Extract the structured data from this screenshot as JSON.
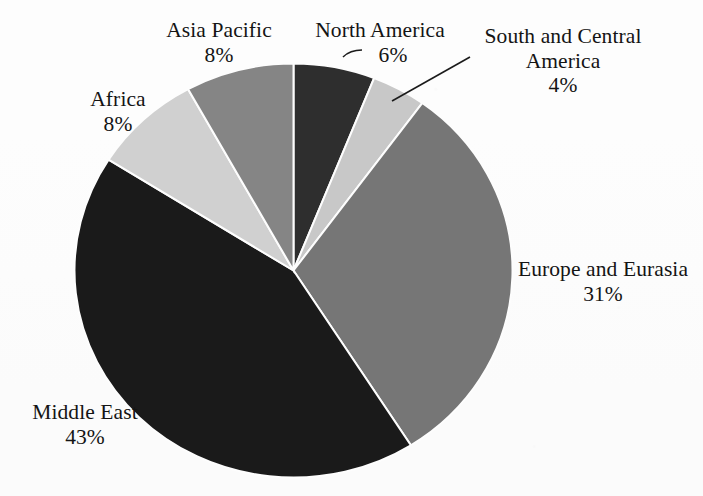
{
  "figure": {
    "background_color": "#fdfdfd",
    "text_color": "#141414"
  },
  "chart_data": {
    "type": "pie",
    "title": "",
    "subtitle": "",
    "xlabel": "",
    "ylabel": "",
    "legend_position": "none",
    "labels_position": "outside",
    "start_angle_deg": 0,
    "direction": "clockwise",
    "categories": [
      "North America",
      "South and Central America",
      "Europe and Eurasia",
      "Middle East",
      "Africa",
      "Asia Pacific"
    ],
    "values": [
      6,
      4,
      31,
      43,
      8,
      8
    ],
    "value_unit": "%",
    "total": 100,
    "slices": [
      {
        "name": "North America",
        "value": 6,
        "value_label": "6%",
        "color": "#2e2e2e",
        "start_deg": 0.0,
        "end_deg": 21.6,
        "has_leader_line": true
      },
      {
        "name": "South and Central America",
        "value": 4,
        "value_label": "4%",
        "color": "#c8c8c8",
        "start_deg": 21.6,
        "end_deg": 36.0,
        "has_leader_line": true
      },
      {
        "name": "Europe and Eurasia",
        "value": 31,
        "value_label": "31%",
        "color": "#767676",
        "start_deg": 36.0,
        "end_deg": 147.6,
        "has_leader_line": false
      },
      {
        "name": "Middle East",
        "value": 43,
        "value_label": "43%",
        "color": "#1a1a1a",
        "start_deg": 147.6,
        "end_deg": 302.4,
        "has_leader_line": false
      },
      {
        "name": "Africa",
        "value": 8,
        "value_label": "8%",
        "color": "#d0d0d0",
        "start_deg": 302.4,
        "end_deg": 331.2,
        "has_leader_line": false
      },
      {
        "name": "Asia Pacific",
        "value": 8,
        "value_label": "8%",
        "color": "#858585",
        "start_deg": 331.2,
        "end_deg": 360.0,
        "has_leader_line": false
      }
    ]
  },
  "labels": {
    "asia_pacific": {
      "name": "Asia Pacific",
      "pct": "8%"
    },
    "north_america": {
      "name": "North America",
      "pct": "6%"
    },
    "south_central": {
      "name": "South and Central America",
      "pct": "4%"
    },
    "africa": {
      "name": "Africa",
      "pct": "8%"
    },
    "europe_eurasia": {
      "name": "Europe and Eurasia",
      "pct": "31%"
    },
    "middle_east": {
      "name": "Middle East",
      "pct": "43%"
    }
  }
}
